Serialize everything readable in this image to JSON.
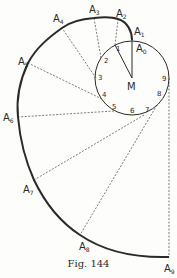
{
  "figure": {
    "caption": "Fig. 144",
    "center_label": "M",
    "point_labels": [
      "A0",
      "A1",
      "A2",
      "A3",
      "A4",
      "A5",
      "A6",
      "A7",
      "A8",
      "A9"
    ],
    "tick_labels": [
      "1",
      "2",
      "3",
      "4",
      "5",
      "6",
      "7",
      "8",
      "9"
    ],
    "colors": {
      "curve": "#2a2a2a",
      "dashed": "#444444",
      "background": "#fdfdfb"
    }
  }
}
